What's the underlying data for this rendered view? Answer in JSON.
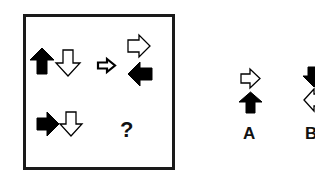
{
  "puzzle": {
    "grid": [
      {
        "cell": "top-left",
        "arrows": [
          {
            "fill": "black",
            "direction": "up"
          },
          {
            "fill": "white",
            "direction": "down"
          }
        ]
      },
      {
        "cell": "transform-indicator",
        "arrows": [
          {
            "fill": "white",
            "direction": "right",
            "style": "thick-outline"
          }
        ]
      },
      {
        "cell": "top-right",
        "arrows": [
          {
            "fill": "white",
            "direction": "right"
          },
          {
            "fill": "black",
            "direction": "left"
          }
        ]
      },
      {
        "cell": "bottom-left",
        "arrows": [
          {
            "fill": "black",
            "direction": "right"
          },
          {
            "fill": "white",
            "direction": "down"
          }
        ]
      }
    ],
    "unknown_symbol": "?"
  },
  "options": [
    {
      "label": "A",
      "arrows": [
        {
          "fill": "white",
          "direction": "right"
        },
        {
          "fill": "black",
          "direction": "up"
        }
      ]
    },
    {
      "label": "B",
      "arrows": [
        {
          "fill": "black",
          "direction": "down"
        },
        {
          "fill": "white",
          "direction": "left"
        }
      ]
    }
  ],
  "colors": {
    "black": "#000000",
    "white": "#ffffff",
    "border": "#1a1a1a"
  }
}
